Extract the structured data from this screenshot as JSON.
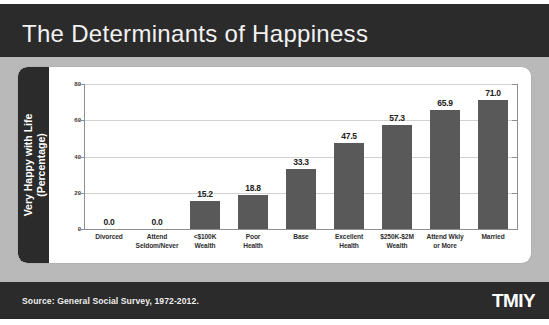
{
  "slide": {
    "title": "The Determinants of Happiness",
    "source_note": "Source: General Social Survey, 1972-2012.",
    "logo": "TMIY",
    "colors": {
      "header_bg": "#2b2b2b",
      "footer_bg": "#2b2b2b",
      "slide_bg": "#b9b9b9",
      "card_bg": "#ffffff",
      "bar_fill": "#595959",
      "gridline": "#d2d2d2",
      "axis_line": "#8e8e8e",
      "title_text": "#f2f2f2"
    }
  },
  "chart_data": {
    "type": "bar",
    "title": "The Determinants of Happiness",
    "xlabel": "",
    "ylabel": "Very Happy with Life (Percentage)",
    "ylabel_line1": "Very Happy with Life",
    "ylabel_line2": "(Percentage)",
    "ylim": [
      0,
      80
    ],
    "yticks": [
      0,
      20,
      40,
      60,
      80
    ],
    "ytick_labels": [
      "0",
      "20",
      "40",
      "60",
      "80"
    ],
    "grid": true,
    "legend": false,
    "categories": [
      "Divorced",
      "Attend Seldom/Never",
      "<$100K Wealth",
      "Poor Health",
      "Base",
      "Excellent Health",
      "$250K-$2M Wealth",
      "Attend Wkly or More",
      "Married"
    ],
    "category_lines": [
      [
        "Divorced",
        ""
      ],
      [
        "Attend",
        "Seldom/Never"
      ],
      [
        "<$100K",
        "Wealth"
      ],
      [
        "Poor",
        "Health"
      ],
      [
        "Base",
        ""
      ],
      [
        "Excellent",
        "Health"
      ],
      [
        "$250K-$2M",
        "Wealth"
      ],
      [
        "Attend Wkly",
        "or More"
      ],
      [
        "Married",
        ""
      ]
    ],
    "values": [
      0.0,
      0.0,
      15.2,
      18.8,
      33.3,
      47.5,
      57.3,
      65.9,
      71.0
    ],
    "value_labels": [
      "0.0",
      "0.0",
      "15.2",
      "18.8",
      "33.3",
      "47.5",
      "57.3",
      "65.9",
      "71.0"
    ]
  }
}
